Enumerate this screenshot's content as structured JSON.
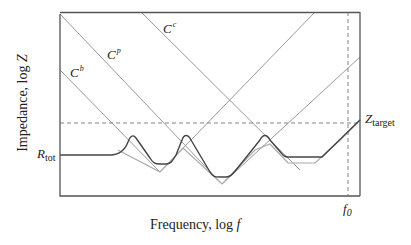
{
  "diagram": {
    "type": "impedance-vs-frequency",
    "y_axis_label": "Impedance, log Z",
    "x_axis_label": "Frequency, log f",
    "y_axis_label_parts": {
      "text": "Impedance, log ",
      "var": "Z"
    },
    "x_axis_label_parts": {
      "text": "Frequency, log ",
      "var": "f"
    },
    "labels": {
      "cb": {
        "base": "C",
        "sup": "b"
      },
      "cp": {
        "base": "C",
        "sup": "p"
      },
      "cc": {
        "base": "C",
        "sup": "c"
      },
      "rtot": {
        "base": "R",
        "sub": "tot"
      },
      "ztarget": {
        "base": "Z",
        "sub": "target"
      },
      "f0": {
        "base": "f",
        "sub": "0"
      }
    },
    "colors": {
      "frame": "#555555",
      "asymptote": "#9a9a9a",
      "ideal_curve": "#aaaaaa",
      "actual_curve": "#444444",
      "dashed_guides": "#777777"
    }
  }
}
